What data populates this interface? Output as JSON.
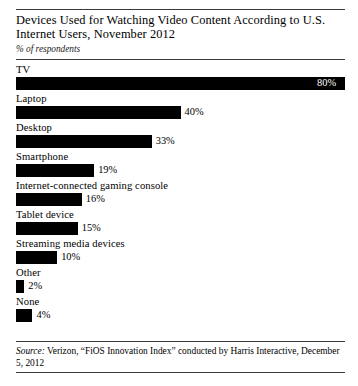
{
  "chart_data": {
    "type": "bar",
    "orientation": "horizontal",
    "title": "Devices Used for Watching Video Content According to U.S. Internet Users, November 2012",
    "subtitle": "% of respondents",
    "xlabel": "",
    "ylabel": "",
    "xlim": [
      0,
      80
    ],
    "grid": false,
    "legend": "none",
    "value_suffix": "%",
    "categories": [
      "TV",
      "Laptop",
      "Desktop",
      "Smartphone",
      "Internet-connected gaming console",
      "Tablet device",
      "Streaming media devices",
      "Other",
      "None"
    ],
    "values": [
      80,
      40,
      33,
      19,
      16,
      15,
      10,
      2,
      4
    ],
    "value_labels": [
      "80%",
      "40%",
      "33%",
      "19%",
      "16%",
      "15%",
      "10%",
      "2%",
      "4%"
    ],
    "bars": [
      {
        "label": "TV",
        "value": 80,
        "value_label": "80%",
        "label_inside": true
      },
      {
        "label": "Laptop",
        "value": 40,
        "value_label": "40%",
        "label_inside": false
      },
      {
        "label": "Desktop",
        "value": 33,
        "value_label": "33%",
        "label_inside": false
      },
      {
        "label": "Smartphone",
        "value": 19,
        "value_label": "19%",
        "label_inside": false
      },
      {
        "label": "Internet-connected gaming console",
        "value": 16,
        "value_label": "16%",
        "label_inside": false
      },
      {
        "label": "Tablet device",
        "value": 15,
        "value_label": "15%",
        "label_inside": false
      },
      {
        "label": "Streaming media devices",
        "value": 10,
        "value_label": "10%",
        "label_inside": false
      },
      {
        "label": "Other",
        "value": 2,
        "value_label": "2%",
        "label_inside": false
      },
      {
        "label": "None",
        "value": 4,
        "value_label": "4%",
        "label_inside": false
      }
    ],
    "bar_color": "#000000",
    "inside_label_color": "#ffffff",
    "background_color": "#ffffff"
  },
  "header": {
    "title": "Devices Used for Watching Video Content According to U.S. Internet Users, November 2012",
    "subtitle": "% of respondents"
  },
  "source": {
    "label": "Source:",
    "text": " Verizon, “FiOS Innovation Index” conducted by Harris Interactive, December 5, 2012"
  }
}
